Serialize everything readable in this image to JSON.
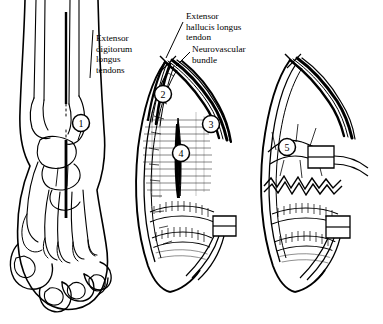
{
  "figure": {
    "type": "anatomical-surgical-illustration",
    "background_color": "#ffffff",
    "ink_color": "#000000",
    "panel_count": 3
  },
  "labels": {
    "extensor_digitorum_longus": {
      "lines": [
        "Extensor",
        "digitorum",
        "longus",
        "tendons"
      ],
      "full_text": "Extensor digitorum longus tendons"
    },
    "extensor_hallucis_longus": {
      "lines": [
        "Extensor",
        "hallucis  longus",
        "tendon"
      ],
      "full_text": "Extensor hallucis longus tendon"
    },
    "neurovascular_bundle": {
      "lines": [
        "Neurovascular",
        "bundle"
      ],
      "full_text": "Neurovascular bundle"
    }
  },
  "markers": [
    {
      "id": "1",
      "number": "1",
      "panel": "left",
      "cx": 81,
      "cy": 123,
      "r": 8.5,
      "meaning": "skin incision line over dorsum of ankle"
    },
    {
      "id": "2",
      "number": "2",
      "panel": "middle",
      "cx": 163,
      "cy": 94,
      "r": 8.5,
      "meaning": "retracted skin and subcutaneous flap"
    },
    {
      "id": "3",
      "number": "3",
      "panel": "middle",
      "cx": 211,
      "cy": 124,
      "r": 8.5,
      "meaning": "neurovascular bundle retracted"
    },
    {
      "id": "4",
      "number": "4",
      "panel": "middle",
      "cx": 181,
      "cy": 153,
      "r": 8.5,
      "meaning": "deep fascia / capsular incision"
    },
    {
      "id": "5",
      "number": "5",
      "panel": "right",
      "cx": 287,
      "cy": 147,
      "r": 8.5,
      "meaning": "exposed joint surface"
    }
  ],
  "panels": [
    {
      "name": "left-panel",
      "caption": "Dorsal view of foot and ankle with skeletal outline and incision line"
    },
    {
      "name": "middle-panel",
      "caption": "Wound retracted exposing extensor tendons and neurovascular bundle"
    },
    {
      "name": "right-panel",
      "caption": "Deep exposure after capsular incision"
    }
  ]
}
